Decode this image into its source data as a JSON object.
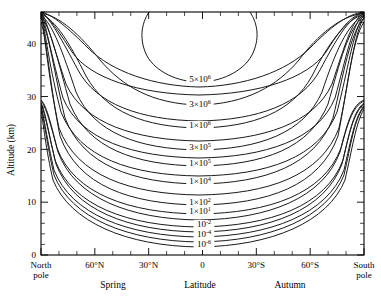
{
  "figure": {
    "title": "",
    "background_color": "#ffffff",
    "line_color": "#1a1a1a"
  },
  "axes": {
    "y": {
      "title": "Altitude (km)",
      "ticks": [
        "0",
        "10",
        "20",
        "30",
        "40"
      ],
      "values": [
        0,
        10,
        20,
        30,
        40
      ],
      "range": [
        0,
        46
      ],
      "minor_step": 2
    },
    "x": {
      "title": "Latitude",
      "ticks": [
        "North\npole",
        "60°N",
        "30°N",
        "0",
        "30°S",
        "60°S",
        "South\npole"
      ],
      "tick_labels": [
        {
          "line1": "North",
          "line2": "pole"
        },
        {
          "line1": "60°N",
          "line2": ""
        },
        {
          "line1": "30°N",
          "line2": ""
        },
        {
          "line1": "0",
          "line2": ""
        },
        {
          "line1": "30°S",
          "line2": ""
        },
        {
          "line1": "60°S",
          "line2": ""
        },
        {
          "line1": "South",
          "line2": "pole"
        }
      ],
      "values": [
        90,
        60,
        30,
        0,
        -30,
        -60,
        -90
      ],
      "range": [
        90,
        -90
      ],
      "minor_step": 10
    },
    "season_left": "Spring",
    "season_right": "Autumn"
  },
  "chart_data": {
    "type": "line",
    "subtype": "contour",
    "title": "",
    "xlabel": "Latitude",
    "ylabel": "Altitude (km)",
    "xlim": [
      90,
      -90
    ],
    "ylim": [
      0,
      46
    ],
    "grid": false,
    "legend": "none",
    "annotations": [
      "Spring",
      "Autumn"
    ],
    "contour_labels": [
      {
        "id": "c5e6",
        "text_mantissa": "5×10",
        "exponent": "6",
        "full": "5×10⁶",
        "x_px": 200,
        "y_px": 82
      },
      {
        "id": "c3e6",
        "text_mantissa": "3×10",
        "exponent": "6",
        "full": "3×10⁶",
        "x_px": 200,
        "y_px": 107
      },
      {
        "id": "c1e6",
        "text_mantissa": "1×10",
        "exponent": "6",
        "full": "1×10⁶",
        "x_px": 200,
        "y_px": 128
      },
      {
        "id": "c3e5",
        "text_mantissa": "3×10",
        "exponent": "5",
        "full": "3×10⁵",
        "x_px": 200,
        "y_px": 150
      },
      {
        "id": "c1e5",
        "text_mantissa": "1×10",
        "exponent": "5",
        "full": "1×10⁵",
        "x_px": 200,
        "y_px": 166
      },
      {
        "id": "c1e4",
        "text_mantissa": "1×10",
        "exponent": "4",
        "full": "1×10⁴",
        "x_px": 200,
        "y_px": 184
      },
      {
        "id": "c1e2",
        "text_mantissa": "1×10",
        "exponent": "2",
        "full": "1×10²",
        "x_px": 200,
        "y_px": 205
      },
      {
        "id": "c1e1",
        "text_mantissa": "1×10",
        "exponent": "1",
        "full": "1×10¹",
        "x_px": 200,
        "y_px": 214
      },
      {
        "id": "c1em2",
        "text_mantissa": "10",
        "exponent": "-2",
        "full": "10⁻²",
        "x_px": 204,
        "y_px": 227
      },
      {
        "id": "c1em4",
        "text_mantissa": "10",
        "exponent": "-4",
        "full": "10⁻⁴",
        "x_px": 204,
        "y_px": 237
      },
      {
        "id": "c1em6",
        "text_mantissa": "10",
        "exponent": "-6",
        "full": "10⁻⁶",
        "x_px": 204,
        "y_px": 247
      }
    ],
    "contour_levels": [
      5000000.0,
      3000000.0,
      1000000.0,
      300000.0,
      100000.0,
      10000.0,
      100.0,
      10.0,
      0.01,
      0.0001,
      1e-06
    ],
    "series": [
      {
        "name": "5×10⁶",
        "closed": true,
        "path": "M 149 12 C 141 24 139 40 147 56 C 156 72 178 82 199 82 C 220 82 243 72 252 55 C 260 39 258 24 250 12"
      },
      {
        "name": "3×10⁶",
        "closed": false,
        "path": "M 41 13 C 60 16 80 35 100 60 C 122 86 152 104 199 105 C 246 104 277 86 299 60 C 318 35 340 16 364 13"
      },
      {
        "name": "1×10⁶",
        "closed": false,
        "path": "M 41 14 C 56 20 70 44 86 76 C 106 112 144 127 199 128 C 254 127 292 112 312 76 C 328 44 345 20 364 14"
      },
      {
        "name": "3×10⁵",
        "closed": false,
        "path": "M 41 15 C 53 24 63 53 76 92 C 94 133 138 149 199 150 C 260 149 304 133 322 92 C 335 53 347 24 364 15"
      },
      {
        "name": "1×10⁵",
        "closed": false,
        "path": "M 41 16 C 51 28 58 62 70 104 C 88 148 134 165 199 166 C 264 165 310 148 328 104 C 340 62 348 28 364 16"
      },
      {
        "name": "1×10⁴",
        "closed": false,
        "path": "M 41 18 C 49 33 54 72 65 118 C 83 165 132 183 199 184 C 266 183 315 165 333 118 C 344 72 350 33 364 18"
      },
      {
        "name": "1×10²",
        "closed": false,
        "path": "M 41 22 C 47 40 50 86 60 136 C 78 186 130 204 199 205 C 268 204 320 186 338 136 C 348 86 352 40 364 22"
      },
      {
        "name": "1×10¹",
        "closed": false,
        "path": "M 41 100 C 46 104 50 120 57 148 C 74 194 129 213 199 214 C 269 213 324 194 341 148 C 348 120 353 104 364 100"
      },
      {
        "name": "10⁻²",
        "closed": false,
        "path": "M 41 103 C 45 110 48 130 55 160 C 72 206 128 226 199 227 C 270 226 326 206 343 160 C 350 130 354 110 364 103"
      },
      {
        "name": "10⁻⁴",
        "closed": false,
        "path": "M 41 106 C 44 116 47 140 54 170 C 71 214 127 236 199 237 C 271 236 327 214 344 170 C 351 140 355 116 364 106"
      },
      {
        "name": "10⁻⁶",
        "closed": false,
        "path": "M 41 109 C 43 122 46 150 53 180 C 70 222 126 246 199 247 C 272 246 328 222 345 180 C 352 150 356 122 364 109"
      },
      {
        "name": "corner-bundle-1",
        "closed": false,
        "path": "M 42 13 C 50 18 62 40 78 70 C 96 104 140 120 199 121 C 258 120 302 104 320 70 C 336 40 348 18 363 13"
      },
      {
        "name": "corner-bundle-2",
        "closed": false,
        "path": "M 42 13 C 47 22 54 48 66 84 C 84 124 136 140 199 141 C 262 140 314 124 332 84 C 344 48 351 22 363 13"
      },
      {
        "name": "corner-bundle-3",
        "closed": false,
        "path": "M 42 14 C 46 26 52 58 63 98 C 80 140 133 157 199 158 C 265 157 318 140 335 98 C 346 58 352 26 363 14"
      },
      {
        "name": "corner-bundle-4",
        "closed": false,
        "path": "M 42 16 C 45 32 50 70 61 112 C 79 158 131 175 199 176 C 267 175 319 158 337 112 C 348 70 353 32 363 16"
      },
      {
        "name": "corner-bundle-5",
        "closed": false,
        "path": "M 42 19 C 45 38 49 82 59 128 C 77 176 130 194 199 195 C 268 194 321 176 339 128 C 349 82 353 38 363 19"
      },
      {
        "name": "lower-left-fan-1",
        "closed": false,
        "path": "M 41 101 C 46 106 51 126 58 152 C 75 198 129 219 199 220 C 269 219 323 198 340 152 C 347 126 352 106 364 101"
      },
      {
        "name": "lower-left-fan-2",
        "closed": false,
        "path": "M 41 104 C 45 113 49 135 56 164 C 73 210 128 231 199 232 C 270 231 325 210 342 164 C 349 135 353 113 364 104"
      },
      {
        "name": "lower-left-fan-3",
        "closed": false,
        "path": "M 41 107 C 44 119 47 145 54 175 C 71 218 127 241 199 242 C 271 241 327 218 344 175 C 351 145 354 119 364 107"
      },
      {
        "name": "top-left-steep-1",
        "closed": false,
        "path": "M 41 12 C 48 16 58 30 72 52 C 90 78 138 94 199 95 C 260 94 308 78 326 52 C 340 30 350 16 364 12"
      },
      {
        "name": "top-left-steep-2",
        "closed": false,
        "path": "M 41 12 C 52 14 68 28 88 48 C 112 72 154 86 199 87 C 244 86 286 72 310 48 C 330 28 346 14 364 12"
      }
    ]
  }
}
